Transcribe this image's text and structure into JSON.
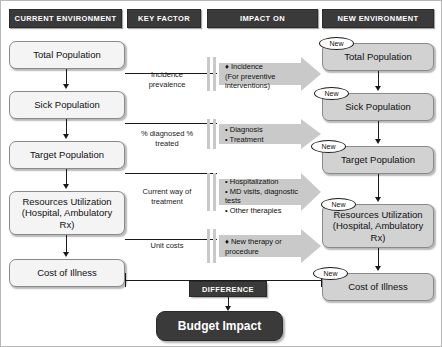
{
  "headers": [
    {
      "label": "CURRENT ENVIRONMENT"
    },
    {
      "label": "KEY FACTOR"
    },
    {
      "label": "IMPACT ON"
    },
    {
      "label": "NEW ENVIRONMENT"
    }
  ],
  "current_environment": {
    "boxes": [
      {
        "label": "Total Population"
      },
      {
        "label": "Sick Population"
      },
      {
        "label": "Target Population"
      },
      {
        "label": "Resources Utilization (Hospital, Ambulatory Rx)"
      },
      {
        "label": "Cost of Illness"
      }
    ]
  },
  "key_factors": [
    {
      "label": "Incidence prevalence"
    },
    {
      "label": "% diagnosed % treated"
    },
    {
      "label": "Current way of treatment"
    },
    {
      "label": "Unit costs"
    }
  ],
  "impact_on": [
    {
      "label": "♦ Incidence\n     (For preventive interventions)"
    },
    {
      "label": "• Diagnosis\n• Treatment"
    },
    {
      "label": "• Hospitalization\n• MD visits, diagnostic tests\n• Other therapies"
    },
    {
      "label": "♦ New therapy or procedure"
    }
  ],
  "new_environment": {
    "badge_label": "New",
    "boxes": [
      {
        "label": "Total Population"
      },
      {
        "label": "Sick Population"
      },
      {
        "label": "Target Population"
      },
      {
        "label": "Resources Utilization (Hospital, Ambulatory Rx)"
      },
      {
        "label": "Cost of Illness"
      }
    ]
  },
  "difference": {
    "label": "DIFFERENCE"
  },
  "result": {
    "label": "Budget Impact"
  },
  "colors": {
    "dark_bar": "#3a3a3a",
    "left_box": "#f4f4f4",
    "right_box": "#d2d2d2",
    "arrow_gray": "#c9c9c9",
    "line": "#1a1a1a",
    "text_light": "#ffffff"
  }
}
